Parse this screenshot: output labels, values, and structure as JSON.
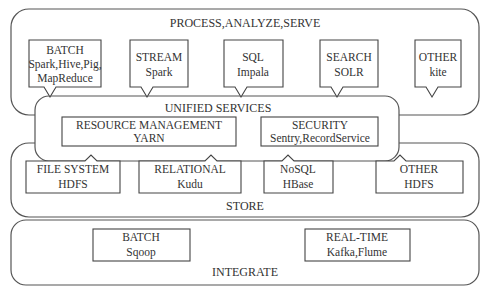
{
  "diagram": {
    "layers": {
      "process": {
        "title": "PROCESS,ANALYZE,SERVE",
        "items": [
          {
            "title": "BATCH",
            "line2": "Spark,Hive,Pig,",
            "line3": "MapReduce"
          },
          {
            "title": "STREAM",
            "line2": "Spark"
          },
          {
            "title": "SQL",
            "line2": "Impala"
          },
          {
            "title": "SEARCH",
            "line2": "SOLR"
          },
          {
            "title": "OTHER",
            "line2": "kite"
          }
        ]
      },
      "unified": {
        "title": "UNIFIED SERVICES",
        "items": [
          {
            "title": "RESOURCE MANAGEMENT",
            "line2": "YARN"
          },
          {
            "title": "SECURITY",
            "line2": "Sentry,RecordService"
          }
        ]
      },
      "store": {
        "title": "STORE",
        "items": [
          {
            "title": "FILE SYSTEM",
            "line2": "HDFS"
          },
          {
            "title": "RELATIONAL",
            "line2": "Kudu"
          },
          {
            "title": "NoSQL",
            "line2": "HBase"
          },
          {
            "title": "OTHER",
            "line2": "HDFS"
          }
        ]
      },
      "integrate": {
        "title": "INTEGRATE",
        "items": [
          {
            "title": "BATCH",
            "line2": "Sqoop"
          },
          {
            "title": "REAL-TIME",
            "line2": "Kafka,Flume"
          }
        ]
      }
    }
  }
}
